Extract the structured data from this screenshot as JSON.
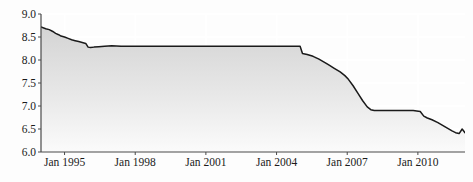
{
  "chart_data": {
    "type": "area",
    "title": "",
    "subtitle": "",
    "xlabel": "",
    "ylabel": "",
    "xlim": [
      "Jan 1994",
      "Jan 2012"
    ],
    "ylim": [
      6.0,
      9.0
    ],
    "grid": true,
    "legend": null,
    "y_ticks": [
      "9.0",
      "8.5",
      "8.0",
      "7.5",
      "7.0",
      "6.5",
      "6.0"
    ],
    "y_tick_values": [
      9.0,
      8.5,
      8.0,
      7.5,
      7.0,
      6.5,
      6.0
    ],
    "x_ticks": [
      "Jan 1995",
      "Jan 1998",
      "Jan 2001",
      "Jan 2004",
      "Jan 2007",
      "Jan 2010"
    ],
    "x_tick_years": [
      1995,
      1998,
      2001,
      2004,
      2007,
      2010
    ],
    "line_color": "#1a1a1a",
    "fill_color": "#d8d8d8",
    "grid_color": "#ffffff",
    "axis_color": "#555555",
    "background_color": "#fdfdfd",
    "x": [
      1994.0,
      1994.2,
      1994.35,
      1994.5,
      1994.62,
      1994.75,
      1994.85,
      1995.0,
      1995.15,
      1995.3,
      1995.45,
      1995.6,
      1995.75,
      1995.9,
      1996.0,
      1996.1,
      1996.25,
      1996.45,
      1996.7,
      1997.0,
      1997.4,
      1997.8,
      1998.2,
      1998.7,
      1999.2,
      1999.8,
      2000.4,
      2001.0,
      2001.6,
      2002.2,
      2002.8,
      2003.4,
      2004.0,
      2004.6,
      2005.0,
      2005.1,
      2005.3,
      2005.55,
      2005.8,
      2006.0,
      2006.2,
      2006.45,
      2006.7,
      2006.9,
      2007.05,
      2007.25,
      2007.45,
      2007.65,
      2007.85,
      2008.0,
      2008.15,
      2008.3,
      2008.5,
      2008.75,
      2009.0,
      2009.4,
      2009.8,
      2010.1,
      2010.25,
      2010.4,
      2010.6,
      2010.85,
      2011.05,
      2011.25,
      2011.45,
      2011.6,
      2011.75,
      2011.88,
      2012.0
    ],
    "y": [
      8.72,
      8.68,
      8.66,
      8.62,
      8.58,
      8.55,
      8.52,
      8.5,
      8.47,
      8.44,
      8.42,
      8.4,
      8.38,
      8.36,
      8.28,
      8.27,
      8.28,
      8.29,
      8.3,
      8.31,
      8.3,
      8.3,
      8.3,
      8.3,
      8.3,
      8.3,
      8.3,
      8.3,
      8.3,
      8.3,
      8.3,
      8.3,
      8.3,
      8.3,
      8.3,
      8.14,
      8.12,
      8.08,
      8.02,
      7.96,
      7.9,
      7.82,
      7.74,
      7.66,
      7.58,
      7.44,
      7.28,
      7.12,
      6.98,
      6.92,
      6.9,
      6.9,
      6.9,
      6.9,
      6.9,
      6.9,
      6.9,
      6.88,
      6.78,
      6.74,
      6.7,
      6.64,
      6.58,
      6.52,
      6.46,
      6.42,
      6.4,
      6.5,
      6.42
    ]
  }
}
